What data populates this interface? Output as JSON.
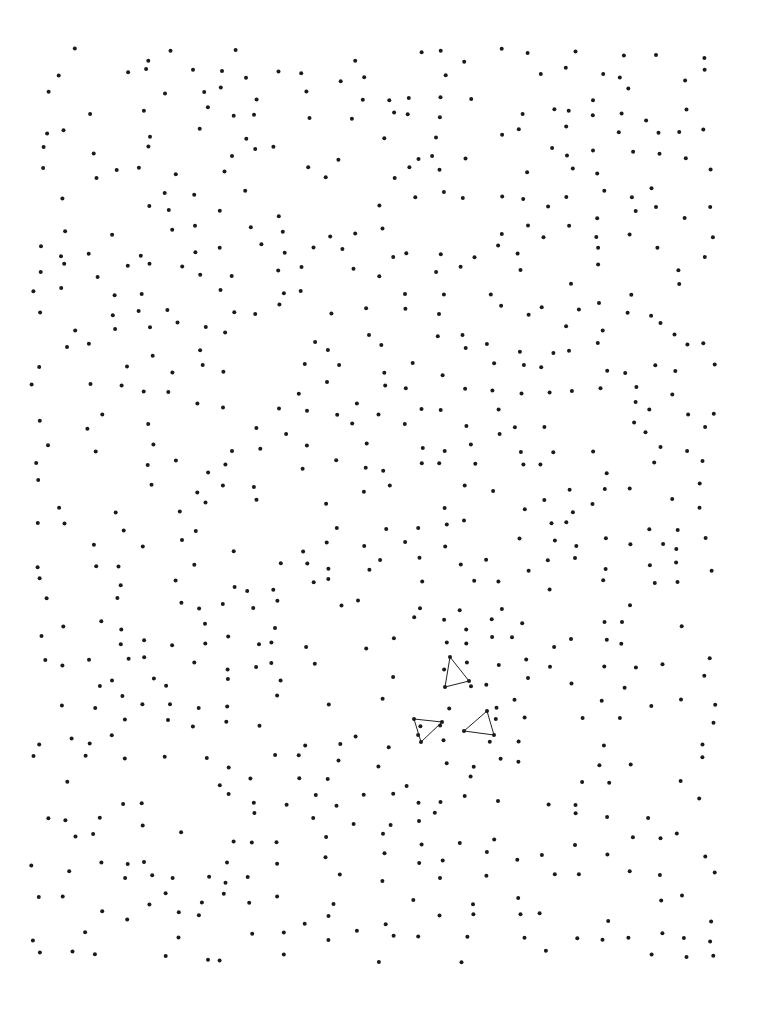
{
  "page": {
    "width": 761,
    "height": 1030,
    "background": "#ffffff"
  },
  "dot_field": {
    "dot_color": "#1a1a1a",
    "dot_radius": 2,
    "region": {
      "x0": 40,
      "y0": 55,
      "x1": 735,
      "y1": 975
    },
    "approx_rows": 47,
    "row_spacing": 19.6,
    "approx_cols": 26,
    "col_spacing": 26.7
  },
  "triangles": [
    {
      "points": [
        [
          450,
          657
        ],
        [
          445,
          687
        ],
        [
          469,
          681
        ]
      ]
    },
    {
      "points": [
        [
          414,
          719
        ],
        [
          442,
          722
        ],
        [
          421,
          742
        ]
      ]
    },
    {
      "points": [
        [
          487,
          711
        ],
        [
          464,
          731
        ],
        [
          494,
          735
        ]
      ]
    }
  ],
  "line_color": "#222222"
}
